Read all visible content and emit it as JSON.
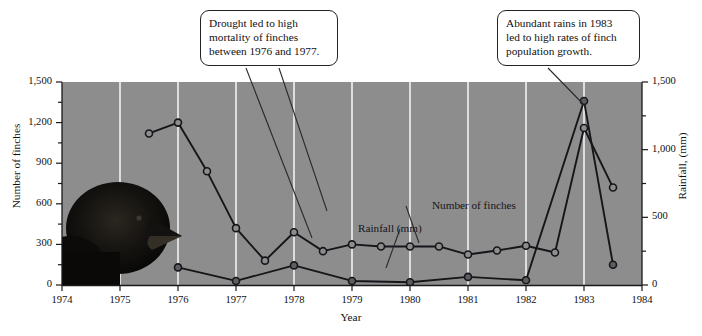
{
  "figure": {
    "background": "#ffffff",
    "plot_background": "#8d8d8d",
    "gridline_color": "#f2f2f2",
    "axis_color": "#1a1a1a",
    "photo_alt": "finch-head-photo"
  },
  "callouts": [
    {
      "id": "drought",
      "text": "Drought led to high\nmortality of finches\nbetween 1976 and 1977."
    },
    {
      "id": "rains",
      "text": "Abundant rains in 1983\nled to high rates of finch\npopulation growth."
    }
  ],
  "series_labels": {
    "rainfall": "Rainfall (mm)",
    "finches": "Number of finches"
  },
  "chart_data": {
    "type": "line",
    "title": "",
    "xlabel": "Year",
    "ylabel": "Number of finches",
    "y2label": "Rainfall, (mm)",
    "xlim": [
      1974,
      1984
    ],
    "ylim": [
      0,
      1500
    ],
    "y2lim": [
      0,
      1500
    ],
    "grid": "vertical-only",
    "legend": "inline-annotations",
    "xticks": [
      1974,
      1975,
      1976,
      1977,
      1978,
      1979,
      1980,
      1981,
      1982,
      1983,
      1984
    ],
    "xtick_labels": [
      "1974",
      "1975",
      "1976",
      "1977",
      "1978",
      "1979",
      "1980",
      "1981",
      "1982",
      "1983",
      "1984"
    ],
    "yticks": [
      0,
      300,
      600,
      900,
      1200,
      1500
    ],
    "ytick_labels": [
      "0",
      "300",
      "600",
      "900",
      "1,200",
      "1,500"
    ],
    "yminor_ticks": [
      150,
      450,
      750,
      1050,
      1350
    ],
    "y2ticks": [
      0,
      500,
      1000,
      1500
    ],
    "y2tick_labels": [
      "0",
      "500",
      "1,000",
      "1,500"
    ],
    "y2minor_ticks": [
      250,
      750,
      1250
    ],
    "series": [
      {
        "name": "Number of finches",
        "marker": "open-circle",
        "color": "#16161a",
        "marker_fill": "#8d8d8d",
        "points": [
          {
            "x": 1975.5,
            "y": 1120
          },
          {
            "x": 1976.0,
            "y": 1200
          },
          {
            "x": 1976.5,
            "y": 840
          },
          {
            "x": 1977.0,
            "y": 420
          },
          {
            "x": 1977.5,
            "y": 180
          },
          {
            "x": 1978.0,
            "y": 390
          },
          {
            "x": 1978.5,
            "y": 250
          },
          {
            "x": 1979.0,
            "y": 300
          },
          {
            "x": 1979.5,
            "y": 285
          },
          {
            "x": 1980.0,
            "y": 285
          },
          {
            "x": 1980.5,
            "y": 285
          },
          {
            "x": 1981.0,
            "y": 225
          },
          {
            "x": 1981.5,
            "y": 255
          },
          {
            "x": 1982.0,
            "y": 290
          },
          {
            "x": 1982.5,
            "y": 240
          },
          {
            "x": 1983.0,
            "y": 1160
          },
          {
            "x": 1983.5,
            "y": 720
          }
        ]
      },
      {
        "name": "Rainfall (mm)",
        "marker": "filled-circle",
        "color": "#16161a",
        "marker_fill": "#5e5e62",
        "points": [
          {
            "x": 1976.0,
            "y": 130
          },
          {
            "x": 1977.0,
            "y": 30
          },
          {
            "x": 1978.0,
            "y": 145
          },
          {
            "x": 1979.0,
            "y": 30
          },
          {
            "x": 1980.0,
            "y": 20
          },
          {
            "x": 1981.0,
            "y": 60
          },
          {
            "x": 1982.0,
            "y": 35
          },
          {
            "x": 1983.0,
            "y": 1360
          },
          {
            "x": 1983.5,
            "y": 150
          }
        ]
      }
    ]
  }
}
